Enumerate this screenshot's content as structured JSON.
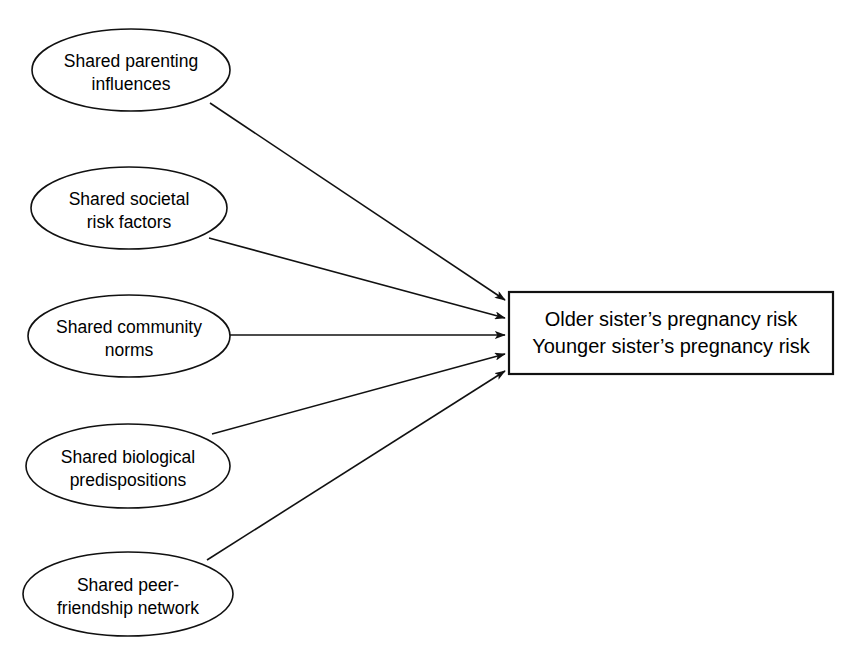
{
  "diagram": {
    "type": "path-diagram",
    "canvas": {
      "width": 853,
      "height": 666,
      "background": "#ffffff"
    },
    "stroke_color": "#111111",
    "fill_color": "#ffffff",
    "predictors": [
      {
        "id": "parenting",
        "shape": "ellipse",
        "line1": "Shared parenting",
        "line2": "influences",
        "cx": 131,
        "cy": 70,
        "rx": 99,
        "ry": 41
      },
      {
        "id": "societal",
        "shape": "ellipse",
        "line1": "Shared societal",
        "line2": "risk factors",
        "cx": 129,
        "cy": 208,
        "rx": 98,
        "ry": 41
      },
      {
        "id": "community",
        "shape": "ellipse",
        "line1": "Shared community",
        "line2": "norms",
        "cx": 129,
        "cy": 336,
        "rx": 101,
        "ry": 41
      },
      {
        "id": "biological",
        "shape": "ellipse",
        "line1": "Shared biological",
        "line2": "predispositions",
        "cx": 128,
        "cy": 466,
        "rx": 102,
        "ry": 42
      },
      {
        "id": "peer",
        "shape": "ellipse",
        "line1": "Shared peer-",
        "line2": "friendship network",
        "cx": 128,
        "cy": 594,
        "rx": 105,
        "ry": 42
      }
    ],
    "outcome": {
      "id": "pregnancy-risk",
      "shape": "rectangle",
      "line1": "Older sister’s pregnancy risk",
      "line2": "Younger sister’s pregnancy risk",
      "x": 509,
      "y": 292,
      "width": 324,
      "height": 82
    },
    "edges": [
      {
        "id": "parenting-to-outcome",
        "from": "parenting",
        "to": "pregnancy-risk",
        "x1": 210,
        "y1": 103,
        "x2": 505,
        "y2": 300,
        "arrowhead": "filled"
      },
      {
        "id": "societal-to-outcome",
        "from": "societal",
        "to": "pregnancy-risk",
        "x1": 209,
        "y1": 238,
        "x2": 505,
        "y2": 318,
        "arrowhead": "filled"
      },
      {
        "id": "community-to-outcome",
        "from": "community",
        "to": "pregnancy-risk",
        "x1": 230,
        "y1": 335,
        "x2": 505,
        "y2": 335,
        "arrowhead": "filled"
      },
      {
        "id": "biological-to-outcome",
        "from": "biological",
        "to": "pregnancy-risk",
        "x1": 212,
        "y1": 434,
        "x2": 505,
        "y2": 354,
        "arrowhead": "filled"
      },
      {
        "id": "peer-to-outcome",
        "from": "peer",
        "to": "pregnancy-risk",
        "x1": 207,
        "y1": 560,
        "x2": 505,
        "y2": 371,
        "arrowhead": "filled"
      }
    ]
  }
}
